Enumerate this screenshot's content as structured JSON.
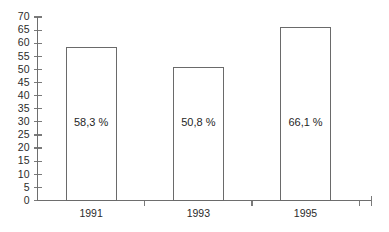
{
  "chart_data": {
    "type": "bar",
    "title": "",
    "subtitle": "",
    "xlabel": "",
    "ylabel": "",
    "categories": [
      "1991",
      "1993",
      "1995"
    ],
    "values": [
      58.3,
      50.8,
      66.1
    ],
    "value_labels": [
      "58,3 %",
      "50,8 %",
      "66,1 %"
    ],
    "ylim": [
      0,
      70
    ],
    "ytick_labels": [
      "0",
      "5",
      "10",
      "15",
      "20",
      "25",
      "30",
      "35",
      "40",
      "45",
      "50",
      "55",
      "60",
      "65",
      "70"
    ],
    "ytick_values": [
      0,
      5,
      10,
      15,
      20,
      25,
      30,
      35,
      40,
      45,
      50,
      55,
      60,
      65,
      70
    ],
    "grid": false,
    "legend": null,
    "legend_position": "none",
    "series": [
      {
        "name": "",
        "values": [
          58.3,
          50.8,
          66.1
        ]
      }
    ],
    "colors": {
      "bar_fill": "#ffffff",
      "bar_stroke": "#6a6a6a",
      "axis": "#6e6e6e",
      "text": "#2b2b2b",
      "background": "#ffffff"
    }
  }
}
